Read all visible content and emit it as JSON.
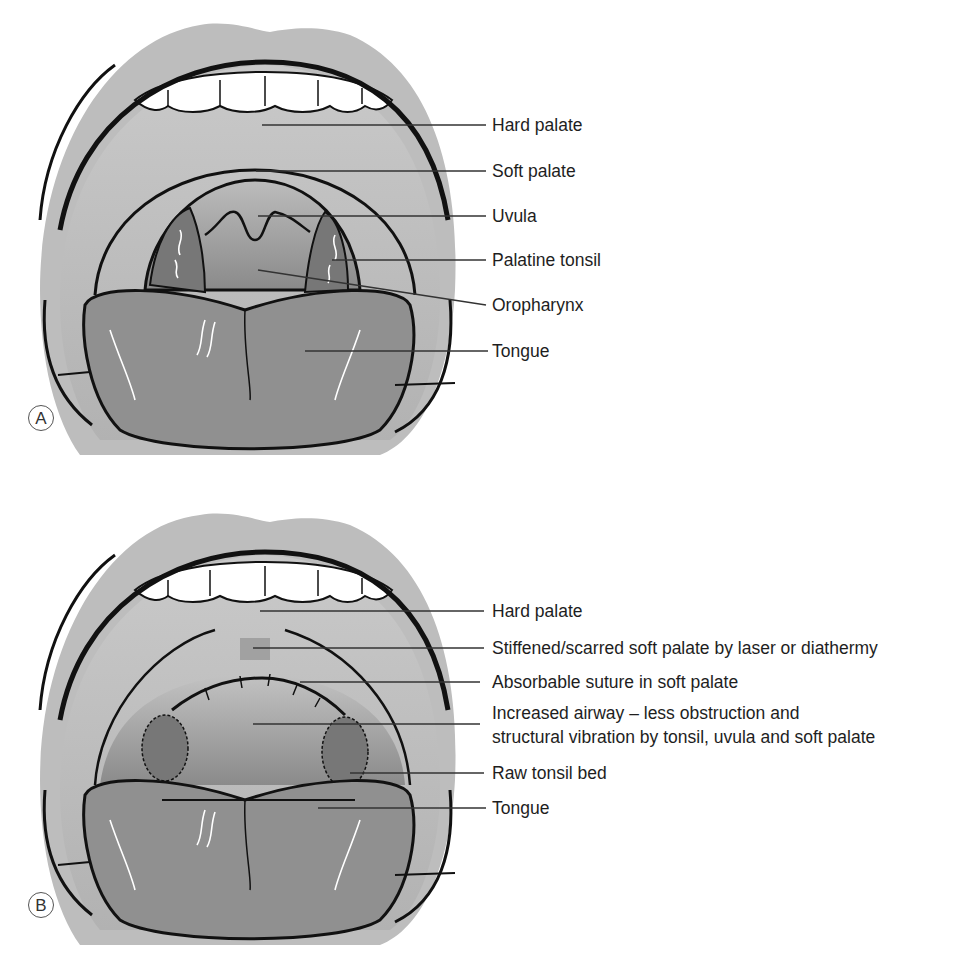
{
  "panels": [
    {
      "id": "A",
      "badge": "A",
      "labels": [
        {
          "text": "Hard palate",
          "y": 125
        },
        {
          "text": "Soft palate",
          "y": 171
        },
        {
          "text": "Uvula",
          "y": 216
        },
        {
          "text": "Palatine tonsil",
          "y": 260
        },
        {
          "text": "Oropharynx",
          "y": 305
        },
        {
          "text": "Tongue",
          "y": 351
        }
      ]
    },
    {
      "id": "B",
      "badge": "B",
      "labels": [
        {
          "text": "Hard palate",
          "y": 611
        },
        {
          "text": "Stiffened/scarred soft palate by laser or diathermy",
          "y": 648
        },
        {
          "text": "Absorbable suture in soft palate",
          "y": 682
        },
        {
          "text": "Increased airway – less obstruction and",
          "y": 713
        },
        {
          "text": "structural vibration by tonsil, uvula and soft palate",
          "y": 737
        },
        {
          "text": "Raw tonsil bed",
          "y": 773
        },
        {
          "text": "Tongue",
          "y": 808
        }
      ]
    }
  ],
  "colors": {
    "lip": "#b8b8b8",
    "palate": "#c4c4c4",
    "tongue": "#8f8f8f",
    "tonsil": "#7a7a7a",
    "outline": "#111111",
    "leader": "#333333"
  }
}
